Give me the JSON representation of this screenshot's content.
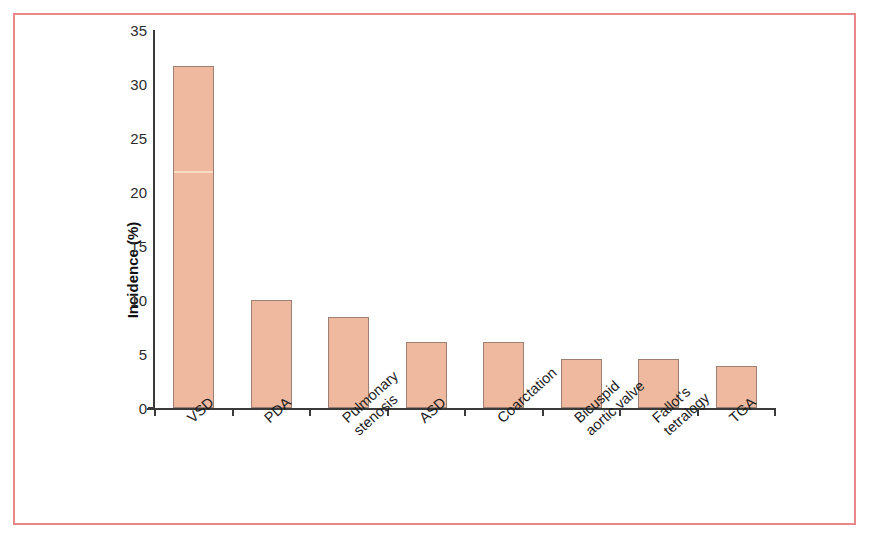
{
  "figure": {
    "background_color": "#ffffff",
    "frame_color": "#e8888a"
  },
  "chart_data": {
    "type": "bar",
    "title": "",
    "xlabel": "",
    "ylabel": "Incidence (%)",
    "categories": [
      "VSD",
      "PDA",
      "Pulmonary\nstenosis",
      "ASD",
      "Coarctation",
      "Bicuspid\naortic valve",
      "Fallot's\ntetralogy",
      "TGA"
    ],
    "category_lines": [
      [
        "VSD"
      ],
      [
        "PDA"
      ],
      [
        "Pulmonary",
        "stenosis"
      ],
      [
        "ASD"
      ],
      [
        "Coarctation"
      ],
      [
        "Bicuspid",
        "aortic valve"
      ],
      [
        "Fallot's",
        "tetralogy"
      ],
      [
        "TGA"
      ]
    ],
    "values": [
      31.7,
      10.0,
      8.4,
      6.1,
      6.1,
      4.5,
      4.5,
      3.9
    ],
    "ylim": [
      0,
      35
    ],
    "yticks": [
      0,
      5,
      10,
      15,
      20,
      25,
      30,
      35
    ],
    "ytick_labels": [
      "0",
      "5",
      "10",
      "15",
      "20",
      "25",
      "30",
      "35"
    ],
    "grid": false,
    "legend": false,
    "bar_color": "#eeb99f",
    "bar_edge_color": "#9a7f72",
    "axis_color": "#3a3a3a"
  }
}
